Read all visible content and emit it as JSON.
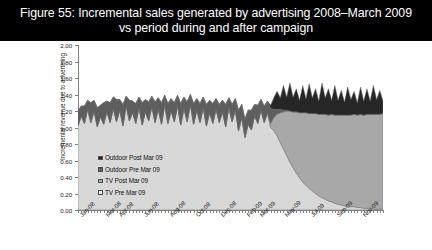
{
  "title": {
    "line1": "Figure 55: Incremental sales generated by advertising 2008–March 2009",
    "line2": "vs period during and after campaign",
    "full": "Figure 55: Incremental sales generated by advertising 2008–March 2009 vs period during and after campaign"
  },
  "colors": {
    "title_background": "#000000",
    "title_text": "#ffffff",
    "plot_background": "#ffffff",
    "axis": "#808080",
    "outdoor_post": "#262626",
    "outdoor_pre": "#5e5e5e",
    "tv_post": "#a8a8a8",
    "tv_pre": "#d8d8d8",
    "series_outline": "#6b6b6b"
  },
  "chart_data": {
    "type": "area",
    "stacked": true,
    "title": "Figure 55: Incremental sales generated by advertising 2008–March 2009 vs period during and after campaign",
    "xlabel": "",
    "ylabel": "Incremental revenue due to advertising",
    "ylim": [
      0.0,
      2.0
    ],
    "ytick_step": 0.2,
    "ytick_labels": [
      "0.00",
      "0.20",
      "0.40",
      "0.60",
      "0.80",
      "1.00",
      "1.20",
      "1.40",
      "1.60",
      "1.80",
      "2.00"
    ],
    "ytick_values": [
      0.0,
      0.2,
      0.4,
      0.6,
      0.8,
      1.0,
      1.2,
      1.4,
      1.6,
      1.8,
      2.0
    ],
    "grid": false,
    "legend_position": "inside-left",
    "xtick_labels": [
      "Jan-08",
      "Mar-08",
      "Apr-08",
      "Jun-08",
      "Aug-08",
      "Oct-08",
      "Dec-08",
      "Feb-09",
      "Mar-09",
      "May-09",
      "Jul-09",
      "Sep-09",
      "Nov-09"
    ],
    "xtick_positions": [
      0,
      8,
      12,
      20,
      28,
      36,
      44,
      52,
      56,
      64,
      72,
      80,
      88
    ],
    "x_count": 96,
    "series": [
      {
        "name": "TV Pre Mar 09",
        "key": "tv_pre",
        "color": "#d8d8d8",
        "values": [
          1.02,
          1.14,
          1.05,
          1.22,
          1.06,
          1.2,
          1.01,
          1.13,
          1.04,
          1.19,
          1.06,
          1.23,
          1.07,
          1.21,
          1.02,
          1.26,
          1.08,
          1.18,
          1.05,
          1.24,
          1.03,
          1.19,
          1.08,
          1.25,
          1.06,
          1.22,
          1.04,
          1.27,
          1.05,
          1.2,
          1.07,
          1.26,
          1.03,
          1.23,
          1.07,
          1.28,
          1.04,
          1.21,
          1.06,
          1.24,
          1.02,
          1.18,
          1.05,
          1.22,
          1.06,
          1.19,
          1.01,
          1.24,
          1.07,
          1.21,
          0.96,
          1.12,
          0.88,
          1.04,
          0.97,
          1.14,
          1.05,
          1.21,
          1.06,
          1.18,
          1.0,
          0.96,
          0.9,
          0.82,
          0.74,
          0.66,
          0.58,
          0.51,
          0.45,
          0.39,
          0.34,
          0.3,
          0.26,
          0.23,
          0.2,
          0.17,
          0.15,
          0.13,
          0.11,
          0.1,
          0.08,
          0.07,
          0.06,
          0.05,
          0.05,
          0.04,
          0.04,
          0.03,
          0.03,
          0.02,
          0.02,
          0.02,
          0.01,
          0.01,
          0.01,
          0.01
        ]
      },
      {
        "name": "TV Post Mar 09",
        "key": "tv_post",
        "color": "#a8a8a8",
        "values": [
          0,
          0,
          0,
          0,
          0,
          0,
          0,
          0,
          0,
          0,
          0,
          0,
          0,
          0,
          0,
          0,
          0,
          0,
          0,
          0,
          0,
          0,
          0,
          0,
          0,
          0,
          0,
          0,
          0,
          0,
          0,
          0,
          0,
          0,
          0,
          0,
          0,
          0,
          0,
          0,
          0,
          0,
          0,
          0,
          0,
          0,
          0,
          0,
          0,
          0,
          0,
          0,
          0,
          0,
          0,
          0,
          0,
          0,
          0,
          0,
          0.05,
          0.16,
          0.26,
          0.36,
          0.45,
          0.54,
          0.62,
          0.68,
          0.74,
          0.79,
          0.84,
          0.88,
          0.91,
          0.94,
          0.97,
          0.99,
          1.01,
          1.03,
          1.04,
          1.06,
          1.07,
          1.08,
          1.09,
          1.1,
          1.1,
          1.11,
          1.12,
          1.12,
          1.13,
          1.13,
          1.14,
          1.14,
          1.15,
          1.15,
          1.15,
          1.16
        ]
      },
      {
        "name": "Outdoor Pre Mar 09",
        "key": "outdoor_pre",
        "color": "#5e5e5e",
        "values": [
          0.18,
          0.12,
          0.21,
          0.11,
          0.24,
          0.13,
          0.23,
          0.14,
          0.26,
          0.13,
          0.24,
          0.14,
          0.27,
          0.13,
          0.26,
          0.12,
          0.25,
          0.14,
          0.24,
          0.13,
          0.27,
          0.15,
          0.23,
          0.13,
          0.25,
          0.14,
          0.26,
          0.12,
          0.24,
          0.15,
          0.23,
          0.13,
          0.26,
          0.14,
          0.24,
          0.12,
          0.25,
          0.14,
          0.23,
          0.13,
          0.26,
          0.15,
          0.24,
          0.13,
          0.22,
          0.14,
          0.27,
          0.12,
          0.21,
          0.14,
          0.25,
          0.16,
          0.22,
          0.17,
          0.24,
          0.14,
          0.22,
          0.13,
          0.2,
          0.14,
          0.18,
          0.1,
          0.06,
          0.04,
          0.02,
          0.01,
          0.0,
          0.0,
          0.0,
          0.0,
          0.0,
          0.0,
          0.0,
          0.0,
          0.0,
          0.0,
          0.0,
          0.0,
          0.0,
          0.0,
          0.0,
          0.0,
          0.0,
          0.0,
          0.0,
          0.0,
          0.0,
          0.0,
          0.0,
          0.0,
          0.0,
          0.0,
          0.0,
          0.0,
          0.0,
          0.0
        ]
      },
      {
        "name": "Outdoor Post Mar 09",
        "key": "outdoor_post",
        "color": "#262626",
        "values": [
          0,
          0,
          0,
          0,
          0,
          0,
          0,
          0,
          0,
          0,
          0,
          0,
          0,
          0,
          0,
          0,
          0,
          0,
          0,
          0,
          0,
          0,
          0,
          0,
          0,
          0,
          0,
          0,
          0,
          0,
          0,
          0,
          0,
          0,
          0,
          0,
          0,
          0,
          0,
          0,
          0,
          0,
          0,
          0,
          0,
          0,
          0,
          0,
          0,
          0,
          0,
          0,
          0,
          0,
          0,
          0,
          0,
          0,
          0,
          0,
          0.04,
          0.14,
          0.22,
          0.14,
          0.3,
          0.16,
          0.34,
          0.18,
          0.28,
          0.15,
          0.33,
          0.17,
          0.36,
          0.19,
          0.3,
          0.16,
          0.38,
          0.2,
          0.32,
          0.17,
          0.36,
          0.18,
          0.3,
          0.16,
          0.34,
          0.19,
          0.28,
          0.15,
          0.33,
          0.17,
          0.31,
          0.16,
          0.35,
          0.18,
          0.29,
          0.15
        ]
      }
    ]
  },
  "legend": {
    "items": [
      {
        "label": "Outdoor Post Mar 09",
        "color": "#262626"
      },
      {
        "label": "Outdoor Pre Mar 09",
        "color": "#5e5e5e"
      },
      {
        "label": "TV Post Mar 09",
        "color": "#a8a8a8"
      },
      {
        "label": "TV Pre Mar 09",
        "color": "#e8e8e8"
      }
    ]
  }
}
